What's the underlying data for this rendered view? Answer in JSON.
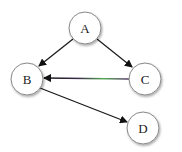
{
  "diagram": {
    "type": "directed-graph",
    "nodes": [
      {
        "id": "A",
        "label": "A",
        "x": 85,
        "y": 28,
        "r": 16
      },
      {
        "id": "B",
        "label": "B",
        "x": 27,
        "y": 79,
        "r": 16
      },
      {
        "id": "C",
        "label": "C",
        "x": 145,
        "y": 79,
        "r": 16
      },
      {
        "id": "D",
        "label": "D",
        "x": 143,
        "y": 128,
        "r": 16
      }
    ],
    "edges": [
      {
        "from": "A",
        "to": "B",
        "color": "#1a1a1a"
      },
      {
        "from": "A",
        "to": "C",
        "color": "#1a1a1a"
      },
      {
        "from": "C",
        "to": "B",
        "color": "#3a2a4a",
        "highlight": "#4caf50"
      },
      {
        "from": "B",
        "to": "D",
        "color": "#1a1a1a"
      }
    ]
  }
}
